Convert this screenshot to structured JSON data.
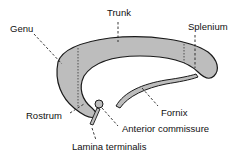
{
  "diagram": {
    "fill_color": "#bdbdbd",
    "outline_color": "#1a1a1a",
    "labels": {
      "genu": "Genu",
      "trunk": "Trunk",
      "splenium": "Splenium",
      "rostrum": "Rostrum",
      "fornix": "Fornix",
      "anterior_commissure": "Anterior commissure",
      "lamina_terminalis": "Lamina terminalis"
    }
  }
}
